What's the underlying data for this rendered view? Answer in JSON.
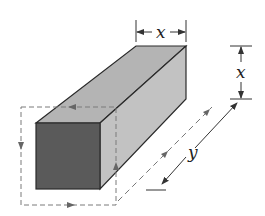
{
  "figure": {
    "type": "isometric rectangular prism with square cross-section",
    "colors": {
      "front_face": "#5a5a5a",
      "top_face": "#b4b4b4",
      "side_face": "#c2c2c2",
      "edge": "#2a2a2a",
      "dashed": "#7a7a7a",
      "dimension": "#333333"
    },
    "labels": {
      "top_width": "x",
      "side_height": "x",
      "length": "y"
    }
  }
}
